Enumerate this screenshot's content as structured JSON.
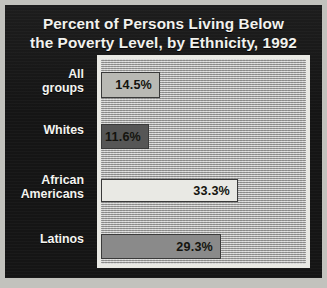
{
  "title": {
    "line1": "Percent of Persons Living Below",
    "line2": "the Poverty Level, by Ethnicity, 1992"
  },
  "chart_data": {
    "type": "bar",
    "orientation": "horizontal",
    "title": "Percent of Persons Living Below the Poverty Level, by Ethnicity, 1992",
    "xlabel": "",
    "ylabel": "",
    "xlim": [
      0,
      50
    ],
    "grid": false,
    "legend": null,
    "categories": [
      "All groups",
      "Whites",
      "African Americans",
      "Latinos"
    ],
    "values": [
      14.5,
      11.6,
      33.3,
      29.3
    ],
    "data_labels": [
      "14.5%",
      "11.6%",
      "33.3%",
      "29.3%"
    ],
    "bar_colors": [
      "#b9b9b4",
      "#565656",
      "#e9e9e4",
      "#8a8a8a"
    ],
    "bars": [
      {
        "label_line1": "All",
        "label_line2": "groups",
        "value": 14.5,
        "value_label": "14.5%",
        "color": "#b9b9b4"
      },
      {
        "label_line1": "Whites",
        "label_line2": "",
        "value": 11.6,
        "value_label": "11.6%",
        "color": "#565656"
      },
      {
        "label_line1": "African",
        "label_line2": "Americans",
        "value": 33.3,
        "value_label": "33.3%",
        "color": "#e9e9e4"
      },
      {
        "label_line1": "Latinos",
        "label_line2": "",
        "value": 29.3,
        "value_label": "29.3%",
        "color": "#8a8a8a"
      }
    ]
  },
  "colors": {
    "panel_background": "#151515",
    "figure_background": "#c2c2bd",
    "title_text": "#f2f2ee",
    "label_text": "#f4f4f0",
    "plot_frame": "#e9e9e4",
    "plot_background": "#b4b4b2"
  }
}
